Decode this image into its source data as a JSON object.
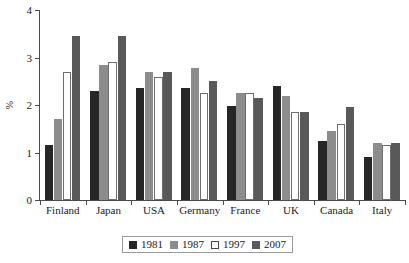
{
  "chart_data": {
    "type": "bar",
    "title": "",
    "subtitle": "",
    "xlabel": "",
    "ylabel": "%",
    "ylim": [
      0,
      4
    ],
    "yticks": [
      0,
      1,
      2,
      3,
      4
    ],
    "ytick_labels": [
      "0",
      "1",
      "2",
      "3",
      "4"
    ],
    "grid": false,
    "legend_position": "bottom",
    "categories": [
      "Finland",
      "Japan",
      "USA",
      "Germany",
      "France",
      "UK",
      "Canada",
      "Italy"
    ],
    "series": [
      {
        "name": "1981",
        "color": "#262626",
        "values": [
          1.15,
          2.3,
          2.35,
          2.35,
          1.97,
          2.4,
          1.25,
          0.9
        ]
      },
      {
        "name": "1987",
        "color": "#8c8c8c",
        "values": [
          1.7,
          2.85,
          2.7,
          2.78,
          2.25,
          2.2,
          1.45,
          1.2
        ]
      },
      {
        "name": "1997",
        "color": "#ffffff",
        "values": [
          2.7,
          2.9,
          2.6,
          2.25,
          2.25,
          1.85,
          1.6,
          1.15
        ]
      },
      {
        "name": "2007",
        "color": "#595959",
        "values": [
          3.45,
          3.45,
          2.7,
          2.5,
          2.15,
          1.85,
          1.95,
          1.2
        ]
      }
    ]
  },
  "axis": {
    "y_title": "%"
  },
  "legend": {
    "entries": [
      {
        "label": "1981",
        "swatch": "black-square-icon"
      },
      {
        "label": "1987",
        "swatch": "gray-square-icon"
      },
      {
        "label": "1997",
        "swatch": "white-square-icon"
      },
      {
        "label": "2007",
        "swatch": "dark-gray-square-icon"
      }
    ]
  }
}
